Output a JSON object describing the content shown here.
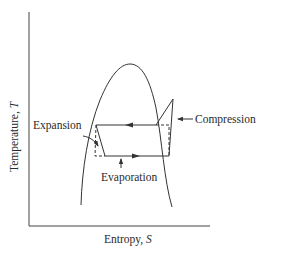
{
  "diagram": {
    "type": "T-S diagram (vapor-compression refrigeration cycle)",
    "axes": {
      "x_label_prefix": "Entropy, ",
      "x_label_symbol": "S",
      "y_label_prefix": "Temperature, ",
      "y_label_symbol": "T"
    },
    "annotations": {
      "expansion": "Expansion",
      "compression": "Compression",
      "evaporation": "Evaporation"
    },
    "colors": {
      "line": "#333333",
      "background": "#ffffff"
    }
  }
}
